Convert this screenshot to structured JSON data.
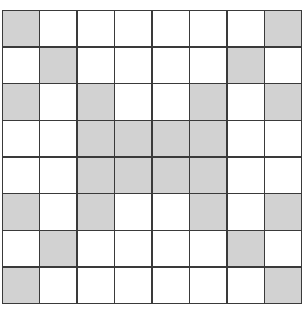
{
  "grid": {
    "rows": 8,
    "cols": 8,
    "colors": {
      "shaded": "#d2d2d2",
      "empty": "#ffffff",
      "line": "#3a3a3a"
    },
    "cells": [
      [
        1,
        0,
        0,
        0,
        0,
        0,
        0,
        1
      ],
      [
        0,
        1,
        0,
        0,
        0,
        0,
        1,
        0
      ],
      [
        1,
        0,
        1,
        0,
        0,
        1,
        0,
        1
      ],
      [
        0,
        0,
        1,
        1,
        1,
        1,
        0,
        0
      ],
      [
        0,
        0,
        1,
        1,
        1,
        1,
        0,
        0
      ],
      [
        1,
        0,
        1,
        0,
        0,
        1,
        0,
        1
      ],
      [
        0,
        1,
        0,
        0,
        0,
        0,
        1,
        0
      ],
      [
        1,
        0,
        0,
        0,
        0,
        0,
        0,
        1
      ]
    ]
  }
}
